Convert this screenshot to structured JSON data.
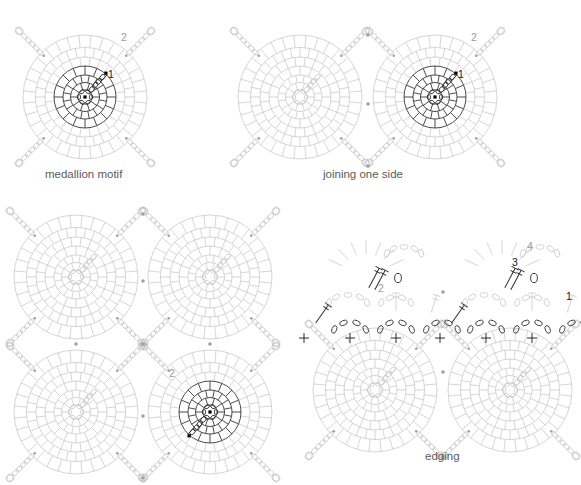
{
  "page": {
    "background": "#ffffff",
    "width": 581,
    "height": 485
  },
  "colors": {
    "light_stitch": "#b9b9c2",
    "mid_stitch": "#9a9aa6",
    "dark_stitch": "#2b2b2b",
    "caption_text": "#5b5b5b",
    "label_gray": "#9a9aa6",
    "label_dark": "#1a1a1a",
    "join_dot": "#a0a0a8",
    "start_dot": "#000000"
  },
  "panels": [
    {
      "id": "medallion-motif",
      "caption": "medallion motif",
      "caption_x": 45,
      "caption_y": 178,
      "motifs": [
        {
          "cx": 85,
          "cy": 97,
          "r": 62,
          "highlight": true,
          "rotate": 0,
          "round_labels": [
            {
              "text": "1",
              "x": 108,
              "y": 78,
              "color": "dark"
            },
            {
              "text": "2",
              "x": 121,
              "y": 41,
              "color": "gray"
            }
          ]
        }
      ],
      "corner_loops": [
        "nw",
        "ne",
        "sw",
        "se"
      ],
      "join_dots": []
    },
    {
      "id": "joining-one-side",
      "caption": "joining one side",
      "caption_x": 323,
      "caption_y": 178,
      "motifs": [
        {
          "cx": 300,
          "cy": 97,
          "r": 62,
          "highlight": false,
          "rotate": 0,
          "round_labels": []
        },
        {
          "cx": 435,
          "cy": 97,
          "r": 62,
          "highlight": true,
          "rotate": 0,
          "round_labels": [
            {
              "text": "1",
              "x": 458,
              "y": 78,
              "color": "dark"
            },
            {
              "text": "2",
              "x": 471,
              "y": 41,
              "color": "gray"
            }
          ]
        }
      ],
      "corner_loops": [
        "nw",
        "ne",
        "sw",
        "se"
      ],
      "join_dots": [
        {
          "x": 368,
          "y": 35
        },
        {
          "x": 368,
          "y": 104
        },
        {
          "x": 368,
          "y": 166
        }
      ]
    },
    {
      "id": "four-motif-grid",
      "caption": "",
      "caption_x": 0,
      "caption_y": 0,
      "motifs": [
        {
          "cx": 76,
          "cy": 277,
          "r": 62,
          "highlight": false,
          "rotate": 0,
          "round_labels": []
        },
        {
          "cx": 210,
          "cy": 277,
          "r": 62,
          "highlight": false,
          "rotate": 0,
          "round_labels": []
        },
        {
          "cx": 76,
          "cy": 412,
          "r": 62,
          "highlight": false,
          "rotate": 0,
          "round_labels": []
        },
        {
          "cx": 210,
          "cy": 412,
          "r": 62,
          "highlight": true,
          "rotate": 180,
          "round_labels": [
            {
              "text": "2",
              "x": 251,
              "y": 447,
              "color": "gray"
            }
          ]
        }
      ],
      "corner_loops": [
        "nw",
        "ne",
        "sw",
        "se"
      ],
      "join_dots": [
        {
          "x": 143,
          "y": 214
        },
        {
          "x": 143,
          "y": 281
        },
        {
          "x": 143,
          "y": 344
        },
        {
          "x": 76,
          "y": 344
        },
        {
          "x": 210,
          "y": 344
        },
        {
          "x": 143,
          "y": 416
        },
        {
          "x": 143,
          "y": 478
        }
      ]
    },
    {
      "id": "edging",
      "caption": "edging",
      "caption_x": 425,
      "caption_y": 460,
      "motifs": [
        {
          "cx": 375,
          "cy": 390,
          "r": 62,
          "highlight": false,
          "rotate": 0,
          "round_labels": []
        },
        {
          "cx": 510,
          "cy": 390,
          "r": 62,
          "highlight": false,
          "rotate": 0,
          "round_labels": []
        }
      ],
      "corner_loops": [
        "nw",
        "ne",
        "sw",
        "se"
      ],
      "join_dots": [
        {
          "x": 443,
          "y": 292
        },
        {
          "x": 443,
          "y": 372
        },
        {
          "x": 443,
          "y": 457
        }
      ],
      "edge_rows": [
        {
          "label": "1",
          "label_x": 566,
          "label_y": 300,
          "color": "dark",
          "description": "single crochet and chain arcs"
        },
        {
          "label": "2",
          "label_x": 378,
          "label_y": 292,
          "color": "gray",
          "description": "double crochet row"
        },
        {
          "label": "3",
          "label_x": 512,
          "label_y": 266,
          "color": "dark",
          "description": "chain space"
        },
        {
          "label": "4",
          "label_x": 527,
          "label_y": 250,
          "color": "gray",
          "description": "top shell row"
        }
      ]
    }
  ],
  "legend": {
    "symbols": [
      {
        "name": "chain-oval",
        "meaning": "chain stitch"
      },
      {
        "name": "plus-cross",
        "meaning": "single crochet"
      },
      {
        "name": "t-bar",
        "meaning": "double crochet"
      },
      {
        "name": "start-dot",
        "meaning": "round start"
      }
    ]
  }
}
